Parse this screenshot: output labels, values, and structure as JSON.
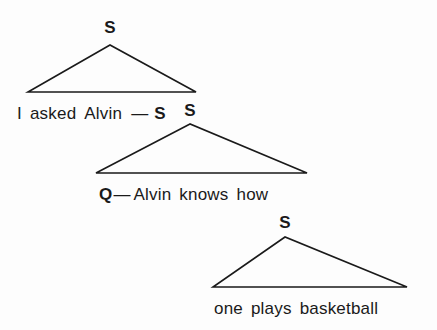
{
  "diagram": {
    "type": "syntax-tree",
    "colors": {
      "background": "#fdfdfd",
      "stroke": "#1a1a1a",
      "text": "#1a1a1a"
    },
    "nodes": [
      {
        "id": "s1",
        "label": "S",
        "apex_x": 110,
        "apex_y": 27,
        "triangle": {
          "apex_x": 110,
          "apex_y": 45,
          "left_x": 28,
          "right_x": 196,
          "base_y": 92
        }
      },
      {
        "id": "s2",
        "label": "S",
        "apex_x": 190,
        "apex_y": 110,
        "triangle": {
          "apex_x": 190,
          "apex_y": 124,
          "left_x": 96,
          "right_x": 307,
          "base_y": 173
        }
      },
      {
        "id": "s3",
        "label": "S",
        "apex_x": 285,
        "apex_y": 222,
        "triangle": {
          "apex_x": 285,
          "apex_y": 237,
          "left_x": 213,
          "right_x": 407,
          "base_y": 287
        }
      }
    ],
    "terminal_rows": [
      {
        "id": "row1",
        "tokens": [
          {
            "kind": "word",
            "text": "I"
          },
          {
            "kind": "word",
            "text": "asked"
          },
          {
            "kind": "word",
            "text": "Alvin"
          },
          {
            "kind": "dash",
            "text": "—"
          },
          {
            "kind": "category",
            "text": "S"
          }
        ]
      },
      {
        "id": "row2",
        "tokens": [
          {
            "kind": "category",
            "text": "Q"
          },
          {
            "kind": "dash",
            "text": "—"
          },
          {
            "kind": "word",
            "text": "Alvin"
          },
          {
            "kind": "word",
            "text": "knows"
          },
          {
            "kind": "word",
            "text": "how"
          }
        ]
      },
      {
        "id": "row3",
        "tokens": [
          {
            "kind": "word",
            "text": "one"
          },
          {
            "kind": "word",
            "text": "plays"
          },
          {
            "kind": "word",
            "text": "basketball"
          }
        ]
      }
    ]
  }
}
